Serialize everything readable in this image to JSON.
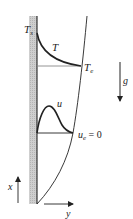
{
  "diagram": {
    "type": "natural-convection-boundary-layer",
    "labels": {
      "wall_temperature": "T",
      "wall_temperature_sub": "s",
      "temperature_profile": "T",
      "edge_temperature": "T",
      "edge_temperature_sub": "e",
      "gravity": "g",
      "velocity_profile": "u",
      "edge_velocity": "u",
      "edge_velocity_sub": "e",
      "edge_velocity_value": " = 0",
      "x_axis": "x",
      "y_axis": "y"
    },
    "colors": {
      "line": "#222222",
      "wall_fill": "#c8c8c8",
      "background": "#ffffff"
    }
  }
}
